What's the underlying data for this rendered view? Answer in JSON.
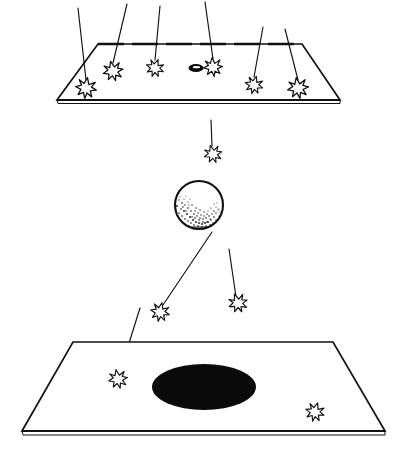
{
  "figure": {
    "background_color": "#ffffff",
    "ink_color": "#111111",
    "width": 407,
    "height": 459
  },
  "upper_plate": {
    "name": "upper detector plate",
    "edge_style_back": "dashed",
    "edge_style_front": "double-line",
    "corners": {
      "back_left": [
        98,
        44
      ],
      "back_right": [
        302,
        44
      ],
      "front_right": [
        340,
        100
      ],
      "front_left": [
        57,
        100
      ]
    },
    "hit_markers": [
      {
        "label": "hit-1",
        "x": 86,
        "y": 88,
        "size": 10.5
      },
      {
        "label": "hit-2",
        "x": 113,
        "y": 71,
        "size": 10.0
      },
      {
        "label": "hit-3",
        "x": 155,
        "y": 68,
        "size": 9.0
      },
      {
        "label": "hit-4",
        "x": 213,
        "y": 67,
        "size": 9.5
      },
      {
        "label": "hit-5",
        "x": 254,
        "y": 85,
        "size": 9.0
      },
      {
        "label": "hit-6",
        "x": 298,
        "y": 88,
        "size": 10.5
      }
    ],
    "aperture": {
      "label": "small dark ellipse marker",
      "x": 196,
      "y": 68,
      "rx": 7.5,
      "ry": 4.0
    },
    "incoming_tracks": [
      {
        "label": "track-in-1",
        "x1": 78,
        "y1": 8,
        "x2": 86,
        "y2": 80
      },
      {
        "label": "track-in-2",
        "x1": 127,
        "y1": 4,
        "x2": 113,
        "y2": 63
      },
      {
        "label": "track-in-3",
        "x1": 160,
        "y1": 6,
        "x2": 155,
        "y2": 60
      },
      {
        "label": "track-in-4",
        "x1": 205,
        "y1": 2,
        "x2": 213,
        "y2": 59
      },
      {
        "label": "track-in-5",
        "x1": 263,
        "y1": 27,
        "x2": 254,
        "y2": 77
      },
      {
        "label": "track-in-6",
        "x1": 285,
        "y1": 29,
        "x2": 298,
        "y2": 80
      }
    ]
  },
  "sphere": {
    "name": "target sphere",
    "cx": 199,
    "cy": 205,
    "r": 25,
    "shading": "stippled crescent in lower-left, white highlight upper-right",
    "stipple_density": "dense"
  },
  "middle_track": {
    "label": "track-mid",
    "x1": 211,
    "y1": 120,
    "x2": 212,
    "y2": 146,
    "burst": {
      "label": "hit-mid",
      "x": 213,
      "y": 154,
      "size": 9.0
    }
  },
  "lower_plate": {
    "name": "lower detector plate",
    "edge_style_back": "solid",
    "edge_style_front": "double-line",
    "corners": {
      "back_left": [
        73,
        342
      ],
      "back_right": [
        333,
        342
      ],
      "front_right": [
        385,
        431
      ],
      "front_left": [
        22,
        431
      ]
    },
    "spot": {
      "label": "large black spot",
      "x": 204,
      "y": 387,
      "rx": 52,
      "ry": 23,
      "color": "#0a0a0a"
    },
    "hit_markers": [
      {
        "label": "hit-low-1",
        "x": 118,
        "y": 379,
        "size": 9.5
      },
      {
        "label": "hit-low-2",
        "x": 315,
        "y": 412,
        "size": 9.5
      }
    ],
    "outgoing_tracks": [
      {
        "label": "track-out-left",
        "x1": 212,
        "y1": 232,
        "x2": 163,
        "y2": 305
      },
      {
        "label": "track-out-right",
        "x1": 229,
        "y1": 249,
        "x2": 236,
        "y2": 297
      },
      {
        "label": "track-out-plate-left",
        "x1": 140,
        "y1": 308,
        "x2": 120,
        "y2": 372
      },
      {
        "label": "track-out-plate-right",
        "x1": 305,
        "y1": 370,
        "x2": 313,
        "y2": 405
      }
    ],
    "mid_bursts": [
      {
        "label": "hit-air-left",
        "x": 160,
        "y": 312,
        "size": 9.5
      },
      {
        "label": "hit-air-right",
        "x": 238,
        "y": 303,
        "size": 9.5
      }
    ]
  }
}
